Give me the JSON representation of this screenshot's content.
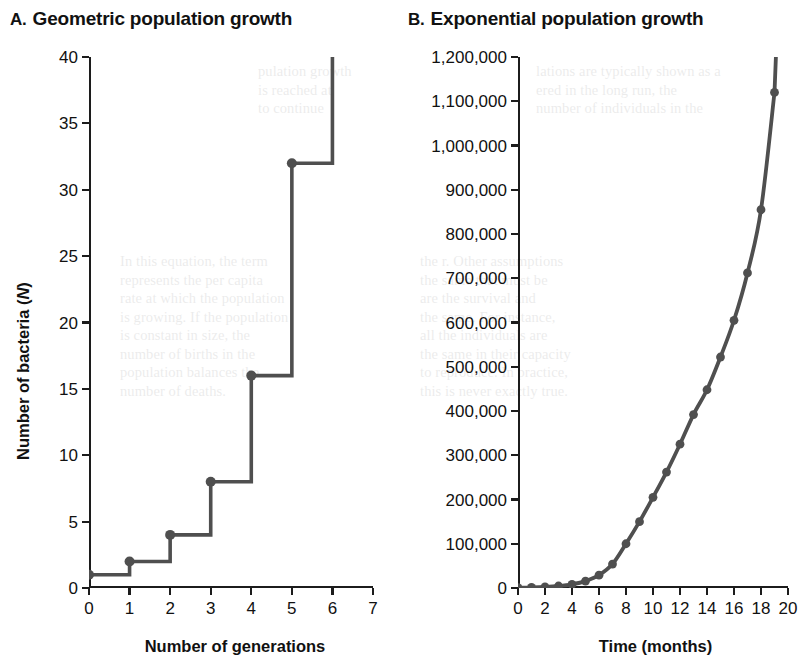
{
  "figure": {
    "background_color": "#ffffff",
    "line_color": "#4f4f4f",
    "axis_color": "#1c1c1c",
    "text_color": "#111111"
  },
  "panel_a": {
    "letter": "A.",
    "title": "Geometric population growth",
    "x_axis_title": "Number of generations",
    "y_axis_title_before": "Number of bacteria (",
    "y_axis_title_italic": "N",
    "y_axis_title_after": ")"
  },
  "panel_b": {
    "letter": "B.",
    "title": "Exponential population growth",
    "x_axis_title": "Time (months)",
    "y_axis_title_before": "Number of individuals (",
    "y_axis_title_italic": "N",
    "y_axis_title_after": ")"
  },
  "bleed_text": {
    "a_top": "pulation growth\nis reached at\nto continue",
    "b_top": "lations are typically shown as a\nered in the long run, the\nnumber of individuals in the",
    "b_mid": "the r. Other assumptions\nthe same that must be\nare the survival and\nthe same. For instance,\nall the individuals are\nthe same in their capacity\nto reproduce. In practice,\nthis is never exactly true.",
    "a_mid": "In this equation, the term\nrepresents the per capita\nrate at which the population\nis growing. If the population\nis constant in size, the\nnumber of births in the\npopulation balances the\nnumber of deaths."
  },
  "chart_data": [
    {
      "panel": "A",
      "type": "line",
      "line_style": "step",
      "title": "Geometric population growth",
      "xlabel": "Number of generations",
      "ylabel": "Number of bacteria (N)",
      "xlim": [
        0,
        7
      ],
      "ylim": [
        0,
        40
      ],
      "xticks": [
        0,
        1,
        2,
        3,
        4,
        5,
        6,
        7
      ],
      "xtick_labels": [
        "0",
        "1",
        "2",
        "3",
        "4",
        "5",
        "6",
        "7"
      ],
      "yticks": [
        0,
        5,
        10,
        15,
        20,
        25,
        30,
        35,
        40
      ],
      "ytick_labels": [
        "0",
        "5",
        "10",
        "15",
        "20",
        "25",
        "30",
        "35",
        "40"
      ],
      "grid": false,
      "legend": false,
      "markers": true,
      "x": [
        0,
        1,
        2,
        3,
        4,
        5,
        6
      ],
      "values": [
        1,
        2,
        4,
        8,
        16,
        32,
        64
      ],
      "note": "Population doubles each generation; final step at generation 6 runs off the top of the 40 axis limit."
    },
    {
      "panel": "B",
      "type": "line",
      "line_style": "smooth",
      "title": "Exponential population growth",
      "xlabel": "Time (months)",
      "ylabel": "Number of individuals (N)",
      "xlim": [
        0,
        20
      ],
      "ylim": [
        0,
        1200000
      ],
      "xticks": [
        0,
        2,
        4,
        6,
        8,
        10,
        12,
        14,
        16,
        18,
        20
      ],
      "xtick_labels": [
        "0",
        "2",
        "4",
        "6",
        "8",
        "10",
        "12",
        "14",
        "16",
        "18",
        "20"
      ],
      "yticks": [
        0,
        100000,
        200000,
        300000,
        400000,
        500000,
        600000,
        700000,
        800000,
        900000,
        1000000,
        1100000,
        1200000
      ],
      "ytick_labels": [
        "0",
        "100,000",
        "200,000",
        "300,000",
        "400,000",
        "500,000",
        "600,000",
        "700,000",
        "800,000",
        "900,000",
        "1,000,000",
        "1,100,000",
        "1,200,000"
      ],
      "grid": false,
      "legend": false,
      "markers": true,
      "x": [
        0,
        1,
        2,
        3,
        4,
        5,
        6,
        7,
        8,
        9,
        10,
        11,
        12,
        13,
        14,
        15,
        16,
        17,
        18,
        19
      ],
      "values": [
        700,
        1300,
        2400,
        4500,
        8400,
        15600,
        29000,
        54000,
        100000,
        150000,
        205000,
        262000,
        325000,
        392000,
        448000,
        522000,
        605000,
        712000,
        855000,
        1120000
      ],
      "note": "Smooth J-shaped exponential curve with circular markers at each month; curve exits the top of the plot just past month 19."
    }
  ]
}
